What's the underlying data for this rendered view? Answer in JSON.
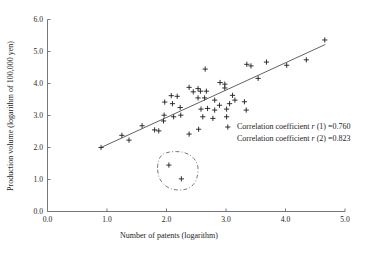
{
  "chart_data": {
    "type": "scatter",
    "title": "",
    "xlabel": "Number of patents (logarithm)",
    "ylabel": "Production volume (logarithm of 100,000 yen)",
    "xlim": [
      0.0,
      5.0
    ],
    "ylim": [
      0.0,
      6.0
    ],
    "x_tick_labels": [
      "0.0",
      "1.0",
      "2.0",
      "3.0",
      "4.0",
      "5.0"
    ],
    "y_tick_labels": [
      "0.0",
      "1.0",
      "2.0",
      "3.0",
      "4.0",
      "5.0",
      "6.0"
    ],
    "grid": false,
    "legend": null,
    "marker": "+",
    "marker_color": "#1c1c1c",
    "trendline_color": "#3a3a3a",
    "points": [
      [
        0.9,
        2.0
      ],
      [
        1.25,
        2.38
      ],
      [
        1.37,
        2.23
      ],
      [
        1.59,
        2.68
      ],
      [
        1.8,
        2.55
      ],
      [
        1.87,
        2.52
      ],
      [
        1.95,
        2.83
      ],
      [
        1.97,
        3.42
      ],
      [
        2.1,
        3.37
      ],
      [
        2.23,
        3.25
      ],
      [
        1.96,
        3.01
      ],
      [
        2.12,
        2.96
      ],
      [
        2.24,
        3.01
      ],
      [
        2.38,
        2.42
      ],
      [
        2.54,
        2.57
      ],
      [
        2.08,
        3.62
      ],
      [
        2.18,
        3.6
      ],
      [
        2.38,
        3.88
      ],
      [
        2.45,
        3.74
      ],
      [
        2.53,
        3.84
      ],
      [
        2.57,
        3.76
      ],
      [
        2.67,
        3.76
      ],
      [
        2.53,
        3.55
      ],
      [
        2.64,
        3.55
      ],
      [
        2.81,
        3.48
      ],
      [
        2.58,
        3.2
      ],
      [
        2.69,
        3.22
      ],
      [
        2.81,
        3.17
      ],
      [
        2.61,
        2.96
      ],
      [
        2.78,
        2.91
      ],
      [
        2.65,
        4.45
      ],
      [
        2.9,
        4.03
      ],
      [
        2.98,
        3.98
      ],
      [
        2.98,
        3.86
      ],
      [
        3.35,
        4.6
      ],
      [
        3.42,
        4.55
      ],
      [
        3.68,
        4.67
      ],
      [
        3.11,
        3.63
      ],
      [
        3.15,
        3.48
      ],
      [
        3.06,
        3.37
      ],
      [
        2.89,
        3.32
      ],
      [
        3.01,
        3.2
      ],
      [
        3.31,
        3.43
      ],
      [
        3.34,
        3.17
      ],
      [
        3.01,
        2.96
      ],
      [
        3.03,
        2.64
      ],
      [
        3.54,
        4.16
      ],
      [
        4.02,
        4.57
      ],
      [
        4.35,
        4.74
      ],
      [
        4.66,
        5.36
      ]
    ],
    "outlier_points": [
      [
        2.04,
        1.45
      ],
      [
        2.25,
        1.02
      ]
    ],
    "outlier_enclosure": {
      "cx": 2.19,
      "cy": 1.27,
      "rx": 0.34,
      "ry": 0.6,
      "style": "dash-dot"
    },
    "trendline": {
      "x1": 0.9,
      "y1": 2.0,
      "x2": 4.67,
      "y2": 5.22
    },
    "annotations": {
      "line1": {
        "prefix": "Correlation coefficient ",
        "symbol": "r",
        "rest": " (1) =0.760"
      },
      "line2": {
        "prefix": "Correlation coefficient ",
        "symbol": "r",
        "rest": " (2) =0.823"
      }
    }
  }
}
